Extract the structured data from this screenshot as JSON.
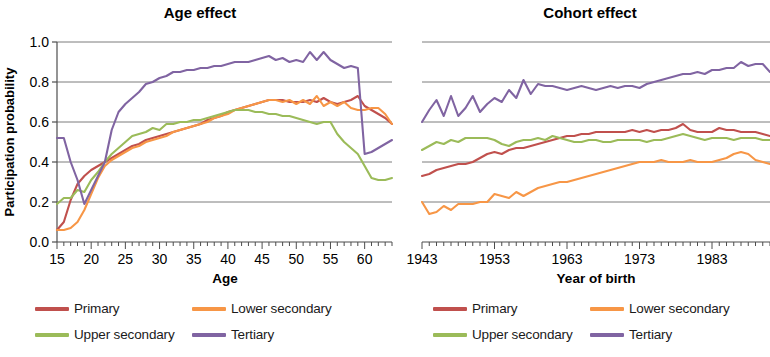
{
  "figure": {
    "panels": [
      {
        "id": "age",
        "title": "Age effect",
        "xlabel": "Age",
        "ylabel": "Participation probability"
      },
      {
        "id": "cohort",
        "title": "Cohort effect",
        "xlabel": "Year of birth",
        "ylabel": ""
      }
    ]
  },
  "legends": [
    {
      "id": "legend-age",
      "items": [
        {
          "label": "Primary",
          "color": "#C0504D"
        },
        {
          "label": "Lower secondary",
          "color": "#F79646"
        },
        {
          "label": "Upper secondary",
          "color": "#9BBB59"
        },
        {
          "label": "Tertiary",
          "color": "#8064A2"
        }
      ]
    },
    {
      "id": "legend-cohort",
      "items": [
        {
          "label": "Primary",
          "color": "#C0504D"
        },
        {
          "label": "Lower secondary",
          "color": "#F79646"
        },
        {
          "label": "Upper secondary",
          "color": "#9BBB59"
        },
        {
          "label": "Tertiary",
          "color": "#8064A2"
        }
      ]
    }
  ],
  "chart_data": [
    {
      "id": "age",
      "type": "line",
      "title": "Age effect",
      "xlabel": "Age",
      "ylabel": "Participation probability",
      "xlim": [
        15,
        64
      ],
      "ylim": [
        0.0,
        1.0
      ],
      "xticks": [
        15,
        20,
        25,
        30,
        35,
        40,
        45,
        50,
        55,
        60
      ],
      "xtick_labels": [
        "15",
        "20",
        "25",
        "30",
        "35",
        "40",
        "45",
        "50",
        "55",
        "60"
      ],
      "yticks": [
        0.0,
        0.2,
        0.4,
        0.6,
        0.8,
        1.0
      ],
      "ytick_labels": [
        "0.0",
        "0.2",
        "0.4",
        "0.6",
        "0.8",
        "1.0"
      ],
      "grid": "horizontal",
      "minor_xticks": 1,
      "legend_position": "below",
      "x": [
        15,
        16,
        17,
        18,
        19,
        20,
        21,
        22,
        23,
        24,
        25,
        26,
        27,
        28,
        29,
        30,
        31,
        32,
        33,
        34,
        35,
        36,
        37,
        38,
        39,
        40,
        41,
        42,
        43,
        44,
        45,
        46,
        47,
        48,
        49,
        50,
        51,
        52,
        53,
        54,
        55,
        56,
        57,
        58,
        59,
        60,
        61,
        62,
        63,
        64
      ],
      "series": [
        {
          "name": "Primary",
          "color": "#C0504D",
          "values": [
            0.06,
            0.1,
            0.21,
            0.29,
            0.33,
            0.36,
            0.38,
            0.4,
            0.42,
            0.44,
            0.46,
            0.48,
            0.49,
            0.51,
            0.52,
            0.53,
            0.54,
            0.55,
            0.56,
            0.57,
            0.58,
            0.59,
            0.61,
            0.62,
            0.63,
            0.65,
            0.66,
            0.67,
            0.68,
            0.69,
            0.7,
            0.71,
            0.71,
            0.71,
            0.7,
            0.7,
            0.7,
            0.71,
            0.7,
            0.72,
            0.7,
            0.69,
            0.7,
            0.71,
            0.73,
            0.68,
            0.66,
            0.64,
            0.62,
            0.59
          ]
        },
        {
          "name": "Lower secondary",
          "color": "#F79646",
          "values": [
            0.06,
            0.06,
            0.07,
            0.1,
            0.16,
            0.24,
            0.32,
            0.38,
            0.41,
            0.43,
            0.45,
            0.47,
            0.48,
            0.5,
            0.51,
            0.52,
            0.53,
            0.55,
            0.56,
            0.57,
            0.58,
            0.59,
            0.6,
            0.62,
            0.63,
            0.64,
            0.66,
            0.67,
            0.68,
            0.69,
            0.7,
            0.71,
            0.71,
            0.7,
            0.71,
            0.69,
            0.71,
            0.69,
            0.73,
            0.68,
            0.7,
            0.68,
            0.7,
            0.67,
            0.66,
            0.66,
            0.67,
            0.67,
            0.64,
            0.59
          ]
        },
        {
          "name": "Upper secondary",
          "color": "#9BBB59",
          "values": [
            0.19,
            0.22,
            0.22,
            0.26,
            0.25,
            0.31,
            0.35,
            0.4,
            0.44,
            0.47,
            0.5,
            0.53,
            0.54,
            0.55,
            0.57,
            0.56,
            0.59,
            0.59,
            0.6,
            0.6,
            0.61,
            0.61,
            0.62,
            0.63,
            0.64,
            0.65,
            0.66,
            0.66,
            0.66,
            0.65,
            0.65,
            0.64,
            0.64,
            0.63,
            0.63,
            0.62,
            0.61,
            0.6,
            0.59,
            0.6,
            0.6,
            0.54,
            0.5,
            0.47,
            0.44,
            0.38,
            0.32,
            0.31,
            0.31,
            0.32
          ]
        },
        {
          "name": "Tertiary",
          "color": "#8064A2",
          "values": [
            0.52,
            0.52,
            0.4,
            0.31,
            0.19,
            0.26,
            0.33,
            0.4,
            0.56,
            0.65,
            0.69,
            0.72,
            0.75,
            0.79,
            0.8,
            0.82,
            0.83,
            0.85,
            0.85,
            0.86,
            0.86,
            0.87,
            0.87,
            0.88,
            0.88,
            0.89,
            0.9,
            0.9,
            0.9,
            0.91,
            0.92,
            0.93,
            0.91,
            0.92,
            0.9,
            0.91,
            0.9,
            0.95,
            0.91,
            0.95,
            0.91,
            0.89,
            0.87,
            0.88,
            0.87,
            0.44,
            0.45,
            0.47,
            0.49,
            0.51
          ]
        }
      ]
    },
    {
      "id": "cohort",
      "type": "line",
      "title": "Cohort effect",
      "xlabel": "Year of birth",
      "ylabel": "",
      "xlim": [
        1943,
        1991
      ],
      "ylim": [
        0.0,
        1.0
      ],
      "xticks": [
        1943,
        1953,
        1963,
        1973,
        1983
      ],
      "xtick_labels": [
        "1943",
        "1953",
        "1963",
        "1973",
        "1983"
      ],
      "yticks": [
        0.0,
        0.2,
        0.4,
        0.6,
        0.8,
        1.0
      ],
      "ytick_labels": [
        "",
        "",
        "",
        "",
        "",
        ""
      ],
      "grid": "horizontal",
      "minor_xticks": 1,
      "legend_position": "below",
      "x": [
        1943,
        1944,
        1945,
        1946,
        1947,
        1948,
        1949,
        1950,
        1951,
        1952,
        1953,
        1954,
        1955,
        1956,
        1957,
        1958,
        1959,
        1960,
        1961,
        1962,
        1963,
        1964,
        1965,
        1966,
        1967,
        1968,
        1969,
        1970,
        1971,
        1972,
        1973,
        1974,
        1975,
        1976,
        1977,
        1978,
        1979,
        1980,
        1981,
        1982,
        1983,
        1984,
        1985,
        1986,
        1987,
        1988,
        1989,
        1990,
        1991
      ],
      "series": [
        {
          "name": "Primary",
          "color": "#C0504D",
          "values": [
            0.33,
            0.34,
            0.36,
            0.37,
            0.38,
            0.39,
            0.39,
            0.4,
            0.42,
            0.44,
            0.45,
            0.44,
            0.46,
            0.47,
            0.47,
            0.48,
            0.49,
            0.5,
            0.51,
            0.52,
            0.53,
            0.53,
            0.54,
            0.54,
            0.55,
            0.55,
            0.55,
            0.55,
            0.55,
            0.56,
            0.55,
            0.56,
            0.55,
            0.56,
            0.56,
            0.57,
            0.59,
            0.56,
            0.55,
            0.55,
            0.55,
            0.57,
            0.56,
            0.56,
            0.55,
            0.55,
            0.55,
            0.54,
            0.53
          ]
        },
        {
          "name": "Lower secondary",
          "color": "#F79646",
          "values": [
            0.2,
            0.14,
            0.15,
            0.18,
            0.16,
            0.19,
            0.19,
            0.19,
            0.2,
            0.2,
            0.24,
            0.23,
            0.22,
            0.25,
            0.23,
            0.25,
            0.27,
            0.28,
            0.29,
            0.3,
            0.3,
            0.31,
            0.32,
            0.33,
            0.34,
            0.35,
            0.36,
            0.37,
            0.38,
            0.39,
            0.4,
            0.4,
            0.4,
            0.41,
            0.4,
            0.4,
            0.4,
            0.41,
            0.4,
            0.4,
            0.4,
            0.41,
            0.42,
            0.44,
            0.45,
            0.44,
            0.41,
            0.4,
            0.39
          ]
        },
        {
          "name": "Upper secondary",
          "color": "#9BBB59",
          "values": [
            0.46,
            0.48,
            0.5,
            0.49,
            0.51,
            0.5,
            0.52,
            0.52,
            0.52,
            0.52,
            0.51,
            0.49,
            0.48,
            0.5,
            0.51,
            0.51,
            0.52,
            0.51,
            0.53,
            0.52,
            0.51,
            0.5,
            0.5,
            0.51,
            0.51,
            0.5,
            0.5,
            0.51,
            0.51,
            0.51,
            0.51,
            0.5,
            0.51,
            0.51,
            0.52,
            0.53,
            0.54,
            0.53,
            0.52,
            0.51,
            0.52,
            0.52,
            0.52,
            0.51,
            0.52,
            0.52,
            0.52,
            0.51,
            0.51
          ]
        },
        {
          "name": "Tertiary",
          "color": "#8064A2",
          "values": [
            0.6,
            0.66,
            0.71,
            0.63,
            0.73,
            0.63,
            0.67,
            0.73,
            0.65,
            0.69,
            0.72,
            0.7,
            0.76,
            0.72,
            0.81,
            0.74,
            0.79,
            0.78,
            0.78,
            0.77,
            0.76,
            0.77,
            0.78,
            0.77,
            0.76,
            0.77,
            0.78,
            0.77,
            0.78,
            0.78,
            0.77,
            0.79,
            0.8,
            0.81,
            0.82,
            0.83,
            0.84,
            0.84,
            0.85,
            0.84,
            0.86,
            0.86,
            0.87,
            0.87,
            0.9,
            0.88,
            0.89,
            0.89,
            0.85
          ]
        }
      ]
    }
  ]
}
